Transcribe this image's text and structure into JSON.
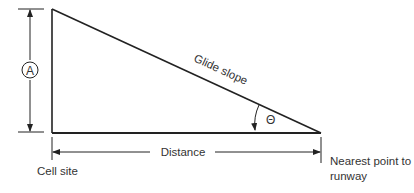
{
  "diagram": {
    "type": "right-triangle glide slope geometry",
    "labels": {
      "height_marker": "A",
      "hypotenuse": "Glide slope",
      "angle": "Θ",
      "base": "Distance",
      "left_point": "Cell site",
      "right_point_line1": "Nearest point to",
      "right_point_line2": "runway"
    },
    "colors": {
      "line": "#222222",
      "text": "#333333",
      "background": "#ffffff"
    }
  }
}
